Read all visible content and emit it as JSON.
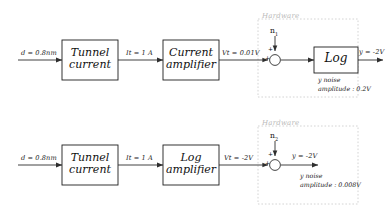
{
  "diagram": {
    "rows": [
      {
        "id": "row-top",
        "input_label": "d = 0.8nm",
        "blocks": [
          {
            "id": "tunnel-current",
            "line1": "Tunnel",
            "line2": "current"
          },
          {
            "id": "current-amplifier",
            "line1": "Current",
            "line2": "amplifier"
          },
          {
            "id": "log",
            "line1": "Log",
            "line2": ""
          }
        ],
        "signals": [
          {
            "id": "it",
            "label": "It = 1 A"
          },
          {
            "id": "vt",
            "label": "Vt = 0.01V"
          },
          {
            "id": "y-out",
            "label": "y = -2V"
          }
        ],
        "noise_source": "n",
        "noise_index": "1",
        "hardware_label": "Hardware",
        "noise_note_line1": "y noise",
        "noise_note_line2": "amplitude : 0.2V",
        "sum_signs": {
          "input": "+",
          "noise": "+"
        }
      },
      {
        "id": "row-bottom",
        "input_label": "d = 0.8nm",
        "blocks": [
          {
            "id": "tunnel-current-2",
            "line1": "Tunnel",
            "line2": "current"
          },
          {
            "id": "log-amplifier",
            "line1": "Log",
            "line2": "amplifier"
          }
        ],
        "signals": [
          {
            "id": "it-2",
            "label": "It = 1 A"
          },
          {
            "id": "vt-2",
            "label": "Vt = -2V"
          },
          {
            "id": "y-out-2",
            "label": "y = -2V"
          }
        ],
        "noise_source": "n",
        "noise_index": "2",
        "hardware_label": "Hardware",
        "noise_note_line1": "y noise",
        "noise_note_line2": "amplitude : 0.008V",
        "sum_signs": {
          "input": "+",
          "noise": "+"
        }
      }
    ],
    "colors": {
      "line": "#3a3a3a",
      "box_stroke": "#1d1d1d",
      "text": "#111111",
      "hardware_dash": "#c9c9c9",
      "hardware_text": "#b9b9b9",
      "background": "#ffffff"
    }
  }
}
